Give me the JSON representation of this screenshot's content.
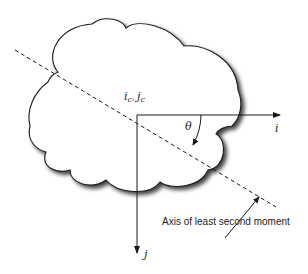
{
  "diagram": {
    "origin_label": {
      "i": "i",
      "i_sub": "c",
      "sep": ", ",
      "j": "j",
      "j_sub": "c"
    },
    "axis_i_label": "i",
    "axis_j_label": "j",
    "angle_label": "θ",
    "callout_label": "Axis of least second moment",
    "colors": {
      "stroke": "#1a1a1a",
      "shadow": "#555555",
      "fill": "#ffffff"
    }
  }
}
